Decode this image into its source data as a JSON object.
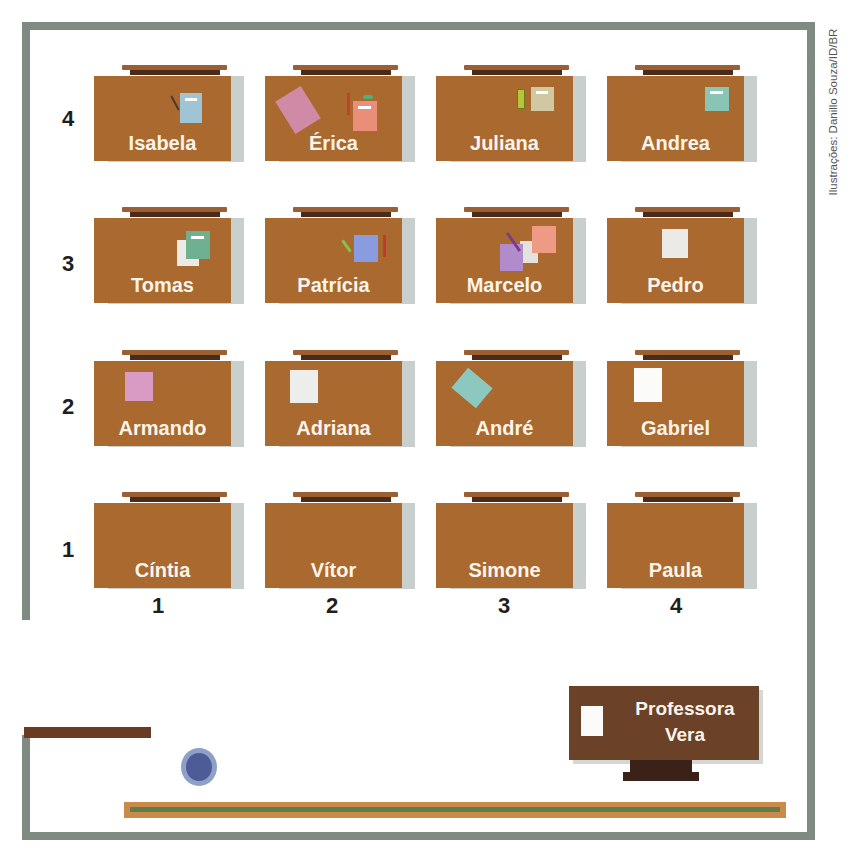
{
  "credit": "Ilustrações: Danillo Souza/ID/BR",
  "row_labels": [
    "4",
    "3",
    "2",
    "1"
  ],
  "column_labels": [
    "1",
    "2",
    "3",
    "4"
  ],
  "rows": [
    {
      "row": "4",
      "desks": [
        {
          "col": "1",
          "name": "Isabela",
          "items": [
            "pencil",
            "blue notebook"
          ]
        },
        {
          "col": "2",
          "name": "Érica",
          "items": [
            "pink paper",
            "coral notebook",
            "pencil",
            "eraser"
          ]
        },
        {
          "col": "3",
          "name": "Juliana",
          "items": [
            "green pencil",
            "beige notebook"
          ]
        },
        {
          "col": "4",
          "name": "Andrea",
          "items": [
            "teal notebook"
          ]
        }
      ]
    },
    {
      "row": "3",
      "desks": [
        {
          "col": "1",
          "name": "Tomas",
          "items": [
            "lined paper",
            "green notebook"
          ]
        },
        {
          "col": "2",
          "name": "Patrícia",
          "items": [
            "green pencil",
            "blue notebook",
            "red pencil"
          ]
        },
        {
          "col": "3",
          "name": "Marcelo",
          "items": [
            "purple paper",
            "pencil",
            "white paper",
            "salmon paper"
          ]
        },
        {
          "col": "4",
          "name": "Pedro",
          "items": [
            "white paper"
          ]
        }
      ]
    },
    {
      "row": "2",
      "desks": [
        {
          "col": "1",
          "name": "Armando",
          "items": [
            "pink paper"
          ]
        },
        {
          "col": "2",
          "name": "Adriana",
          "items": [
            "white paper"
          ]
        },
        {
          "col": "3",
          "name": "André",
          "items": [
            "teal paper"
          ]
        },
        {
          "col": "4",
          "name": "Gabriel",
          "items": [
            "white paper"
          ]
        }
      ]
    },
    {
      "row": "1",
      "desks": [
        {
          "col": "1",
          "name": "Cíntia",
          "items": []
        },
        {
          "col": "2",
          "name": "Vítor",
          "items": []
        },
        {
          "col": "3",
          "name": "Simone",
          "items": []
        },
        {
          "col": "4",
          "name": "Paula",
          "items": []
        }
      ]
    }
  ],
  "teacher_desk": {
    "line1": "Professora",
    "line2": "Vera"
  },
  "colors": {
    "wall": "#7f8a80",
    "desk": "#a9692f",
    "desk_lip": "#9a5f32",
    "desk_lip_dark": "#4b2a18",
    "teacher_desk": "#6b4128",
    "door": "#6b3a22",
    "bin": "#5a6aa0",
    "board_frame": "#c98a4a",
    "board": "#5e7d4a"
  }
}
